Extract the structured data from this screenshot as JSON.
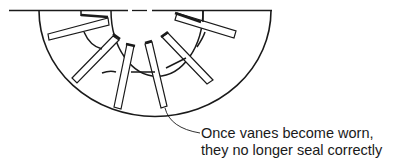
{
  "diagram": {
    "annotation": {
      "line1": "Once vanes become worn,",
      "line2": "they no longer seal correctly"
    },
    "colors": {
      "stroke": "#1a1a1a",
      "background": "#ffffff"
    },
    "vane_count": 7
  }
}
